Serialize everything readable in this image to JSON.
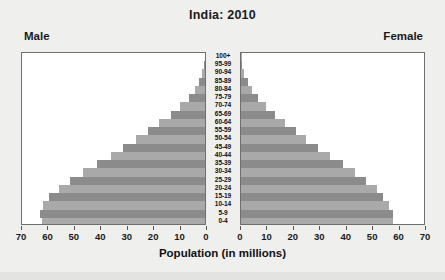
{
  "chart_data": {
    "type": "bar",
    "title": "India: 2010",
    "subtitle": "",
    "xlabel": "Population (in millions)",
    "ylabel": "",
    "left_series_label": "Male",
    "right_series_label": "Female",
    "xlim": [
      0,
      70
    ],
    "xticks": [
      70,
      60,
      50,
      40,
      30,
      20,
      10,
      0,
      0,
      10,
      20,
      30,
      40,
      50,
      60,
      70
    ],
    "left_xticks": [
      70,
      60,
      50,
      40,
      30,
      20,
      10,
      0
    ],
    "right_xticks": [
      0,
      10,
      20,
      30,
      40,
      50,
      60,
      70
    ],
    "grid": false,
    "legend": "none",
    "categories": [
      "100+",
      "95-99",
      "90-94",
      "85-89",
      "80-84",
      "75-79",
      "70-74",
      "65-69",
      "60-64",
      "55-59",
      "50-54",
      "45-49",
      "40-44",
      "35-39",
      "30-34",
      "25-29",
      "20-24",
      "15-19",
      "10-14",
      "5-9",
      "0-4"
    ],
    "series": [
      {
        "name": "Male",
        "side": "left",
        "values": [
          0.1,
          0.4,
          1.0,
          2.2,
          4.0,
          6.3,
          9.5,
          13.2,
          17.5,
          22.0,
          26.5,
          31.5,
          36.0,
          41.5,
          46.5,
          51.5,
          56.0,
          59.5,
          62.0,
          63.0,
          62.5
        ]
      },
      {
        "name": "Female",
        "side": "right",
        "values": [
          0.1,
          0.5,
          1.2,
          2.5,
          4.3,
          6.6,
          9.6,
          13.0,
          17.0,
          21.0,
          25.0,
          29.5,
          34.0,
          39.0,
          43.5,
          48.0,
          52.0,
          54.5,
          56.5,
          58.0,
          58.0
        ]
      }
    ],
    "bar_colors": [
      "#8b8b8b",
      "#a9a9a9"
    ]
  },
  "colors": {
    "figure_background": "#efefed",
    "plot_background": "#ffffff",
    "plot_border": "#6f6f6f",
    "text": "#1a1a1a",
    "bar_dark": "#8b8b8b",
    "bar_light": "#a9a9a9"
  }
}
